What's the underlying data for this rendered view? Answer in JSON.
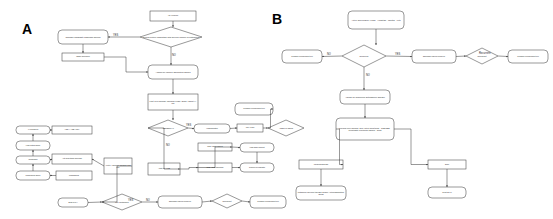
{
  "figure": {
    "panel_a_letter": "A",
    "panel_b_letter": "B",
    "background": "#ffffff",
    "stroke": "#333333",
    "node_fill": "#ffffff"
  },
  "panel_a": {
    "nodes": [
      {
        "id": "a1",
        "shape": "rect",
        "text": "ARI evidence",
        "x": 150,
        "y": 11,
        "w": 46,
        "h": 10
      },
      {
        "id": "a2",
        "shape": "diamond",
        "text": "Clinical picture compatible with specific vaccine or pathogen?",
        "x": 140,
        "y": 27,
        "w": 62,
        "h": 20
      },
      {
        "id": "a3",
        "shape": "round",
        "text": "Consider Candidate diagnosis specific",
        "x": 58,
        "y": 30,
        "w": 50,
        "h": 14
      },
      {
        "id": "a4",
        "shape": "rect",
        "text": "Tissue Specimen",
        "x": 62,
        "y": 53,
        "w": 42,
        "h": 8
      },
      {
        "id": "a5",
        "shape": "round",
        "text": "Assess for vaccine associated causes",
        "x": 148,
        "y": 65,
        "w": 50,
        "h": 14
      },
      {
        "id": "a6",
        "shape": "rect",
        "text": "First level workup: Physical exam / ECG / Chest X-ray",
        "x": 148,
        "y": 94,
        "w": 50,
        "h": 16
      },
      {
        "id": "a7",
        "shape": "diamond",
        "text": "ABNORMAL",
        "x": 148,
        "y": 120,
        "w": 40,
        "h": 16
      },
      {
        "id": "a8",
        "shape": "round",
        "text": "Hospitalization",
        "x": 194,
        "y": 124,
        "w": 36,
        "h": 9
      },
      {
        "id": "a9",
        "shape": "rect",
        "text": "ICU / CCU",
        "x": 237,
        "y": 124,
        "w": 26,
        "h": 8
      },
      {
        "id": "a10",
        "shape": "diamond",
        "text": "ARDS or shock",
        "x": 268,
        "y": 120,
        "w": 36,
        "h": 16
      },
      {
        "id": "a11",
        "shape": "round",
        "text": "Consider convalescent Plu",
        "x": 235,
        "y": 103,
        "w": 38,
        "h": 12
      },
      {
        "id": "a12",
        "shape": "round",
        "text": "IV Therapies",
        "x": 16,
        "y": 126,
        "w": 34,
        "h": 8
      },
      {
        "id": "a13",
        "shape": "rect",
        "text": "ACE-I / ARB / MRA",
        "x": 52,
        "y": 126,
        "w": 40,
        "h": 8
      },
      {
        "id": "a14",
        "shape": "round",
        "text": "High output failure",
        "x": 16,
        "y": 141,
        "w": 34,
        "h": 9
      },
      {
        "id": "a15",
        "shape": "round",
        "text": "Congestion",
        "x": 16,
        "y": 156,
        "w": 34,
        "h": 8
      },
      {
        "id": "a16",
        "shape": "rect",
        "text": "Anti-arrhythmic blockade",
        "x": 52,
        "y": 154,
        "w": 40,
        "h": 10
      },
      {
        "id": "a17",
        "shape": "round",
        "text": "Cardiogenic shock",
        "x": 16,
        "y": 171,
        "w": 34,
        "h": 9
      },
      {
        "id": "a18",
        "shape": "rect",
        "text": "MCS/ECMO",
        "x": 56,
        "y": 171,
        "w": 36,
        "h": 9
      },
      {
        "id": "a19",
        "shape": "rect",
        "text": "Acute / chronic Cardiac and Plu",
        "x": 104,
        "y": 158,
        "w": 28,
        "h": 16
      },
      {
        "id": "a20",
        "shape": "rect",
        "text": "Acute MI / PTE",
        "x": 148,
        "y": 163,
        "w": 32,
        "h": 12
      },
      {
        "id": "a21",
        "shape": "rect",
        "text": "TTE / TEE required",
        "x": 198,
        "y": 143,
        "w": 34,
        "h": 8
      },
      {
        "id": "a22",
        "shape": "round",
        "text": "High acute support",
        "x": 240,
        "y": 143,
        "w": 34,
        "h": 9
      },
      {
        "id": "a23",
        "shape": "rect",
        "text": "TTE / CMR abnormal",
        "x": 198,
        "y": 163,
        "w": 34,
        "h": 9
      },
      {
        "id": "a24",
        "shape": "round",
        "text": "Chronic Myocarditis",
        "x": 240,
        "y": 163,
        "w": 34,
        "h": 9
      },
      {
        "id": "a25",
        "shape": "round",
        "text": "Best Type I",
        "x": 58,
        "y": 198,
        "w": 30,
        "h": 9
      },
      {
        "id": "a26",
        "shape": "diamond",
        "text": "Life sustaining",
        "x": 102,
        "y": 194,
        "w": 40,
        "h": 16
      },
      {
        "id": "a27",
        "shape": "round",
        "text": "Discharge patient Follow up",
        "x": 158,
        "y": 196,
        "w": 44,
        "h": 12
      },
      {
        "id": "a28",
        "shape": "diamond",
        "text": "Recurrent",
        "x": 212,
        "y": 194,
        "w": 30,
        "h": 14
      },
      {
        "id": "a29",
        "shape": "round",
        "text": "Consider convalescent Plu",
        "x": 250,
        "y": 196,
        "w": 36,
        "h": 12
      }
    ],
    "edge_labels": [
      {
        "text": "YES",
        "x": 113,
        "y": 35
      },
      {
        "text": "NO",
        "x": 172,
        "y": 55
      },
      {
        "text": "YES",
        "x": 186,
        "y": 125
      },
      {
        "text": "NO",
        "x": 166,
        "y": 145
      },
      {
        "text": "YES",
        "x": 128,
        "y": 200
      },
      {
        "text": "NO",
        "x": 146,
        "y": 200
      }
    ]
  },
  "panel_b": {
    "nodes": [
      {
        "id": "b1",
        "shape": "round",
        "text": "Active Surveillance (HMN) · Hospitals · Months · Vets",
        "x": 348,
        "y": 11,
        "w": 56,
        "h": 18
      },
      {
        "id": "b2",
        "shape": "diamond",
        "text": "Reservoir",
        "x": 342,
        "y": 45,
        "w": 44,
        "h": 22
      },
      {
        "id": "b3",
        "shape": "round",
        "text": "Consider convalescent Plu",
        "x": 282,
        "y": 50,
        "w": 40,
        "h": 13
      },
      {
        "id": "b4",
        "shape": "round",
        "text": "Discharge patient Follow up",
        "x": 412,
        "y": 50,
        "w": 44,
        "h": 13
      },
      {
        "id": "b5",
        "shape": "diamond",
        "text": "Recurrent",
        "x": 466,
        "y": 48,
        "w": 32,
        "h": 16
      },
      {
        "id": "b6",
        "shape": "round",
        "text": "Consider convalescent Plu",
        "x": 508,
        "y": 50,
        "w": 40,
        "h": 13
      },
      {
        "id": "b7",
        "shape": "round",
        "text": "Assess for underlying autoimmune disease",
        "x": 340,
        "y": 90,
        "w": 50,
        "h": 14
      },
      {
        "id": "b8",
        "shape": "round",
        "text": "Second level workup: 24h Holter monitoring · TTE/TEE · Investigate infectious causes · CMR",
        "x": 336,
        "y": 118,
        "w": 58,
        "h": 22
      },
      {
        "id": "b9",
        "shape": "rect",
        "text": "Infectious Disease",
        "x": 299,
        "y": 160,
        "w": 44,
        "h": 9
      },
      {
        "id": "b10",
        "shape": "rect",
        "text": "DCM",
        "x": 428,
        "y": 160,
        "w": 38,
        "h": 9
      },
      {
        "id": "b11",
        "shape": "round",
        "text": "Pathogen specific therapy and/or Antiinflammatory drugs",
        "x": 296,
        "y": 186,
        "w": 50,
        "h": 14
      },
      {
        "id": "b12",
        "shape": "round",
        "text": "Treat CPAP",
        "x": 428,
        "y": 187,
        "w": 38,
        "h": 11
      }
    ],
    "edge_labels": [
      {
        "text": "NO",
        "x": 327,
        "y": 54
      },
      {
        "text": "YES",
        "x": 395,
        "y": 54
      },
      {
        "text": "NO",
        "x": 366,
        "y": 75
      },
      {
        "text": "Recurrent",
        "x": 479,
        "y": 53
      }
    ]
  }
}
